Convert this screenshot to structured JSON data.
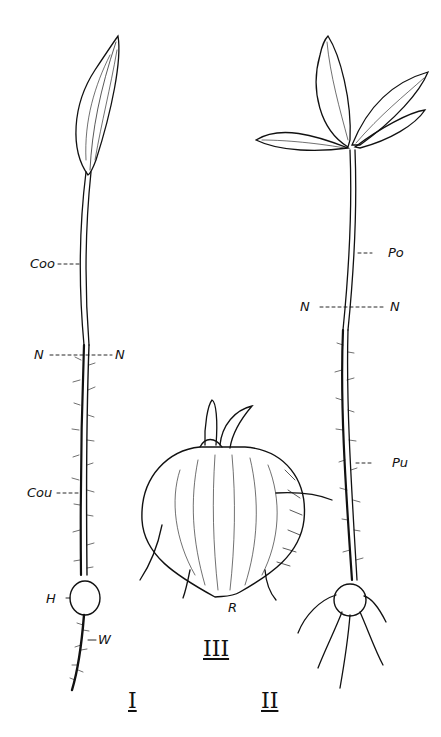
{
  "figure": {
    "type": "botanical-seedling-illustration",
    "panels": [
      {
        "id": "I",
        "numeral": "I",
        "description": "seedling with single elongated leaf, hypocotyl, tuber and root"
      },
      {
        "id": "II",
        "numeral": "II",
        "description": "seedling with three-leaflet crown, hairy lower stem and tuber with roots"
      },
      {
        "id": "III",
        "numeral": "III",
        "description": "enlarged tuber with shoot and rootlets"
      }
    ],
    "labels": {
      "coo": "Coo",
      "n_left_1": "N",
      "n_right_1": "N",
      "cou": "Cou",
      "h": "H",
      "w": "W",
      "po": "Po",
      "n_left_2": "N",
      "n_right_2": "N",
      "pu": "Pu",
      "r": "R"
    },
    "line_color": "#111111",
    "background": "#ffffff"
  }
}
